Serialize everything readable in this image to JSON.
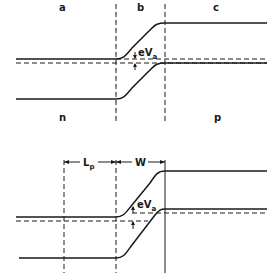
{
  "figure": {
    "top_diagram": {
      "region_labels": [
        "a",
        "b",
        "c"
      ],
      "side_labels": {
        "left": "n",
        "right": "p"
      },
      "voltage_label": {
        "main": "eV",
        "subscript": "a"
      }
    },
    "bottom_diagram": {
      "dimension_labels": {
        "diffusion_length": {
          "main": "L",
          "subscript": "p"
        },
        "depletion_width": "W"
      },
      "voltage_label": {
        "main": "eV",
        "subscript": "a"
      }
    },
    "colors": {
      "line": "#1a1a1a",
      "background": "#ffffff"
    }
  }
}
